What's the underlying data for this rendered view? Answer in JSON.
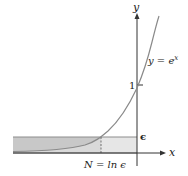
{
  "figure": {
    "type": "diagram",
    "axes": {
      "x_label": "x",
      "y_label": "y"
    },
    "curve_label": "y = e",
    "curve_label_exponent": "x",
    "tick_one": "1",
    "epsilon_label": "ϵ",
    "n_label": "N = ln ϵ",
    "colors": {
      "curve": "#8a8a8a",
      "axis": "#333333",
      "shade_dark": "#c8c8c8",
      "shade_light": "#e6e6e6",
      "band_line": "#8c8c8c"
    }
  }
}
